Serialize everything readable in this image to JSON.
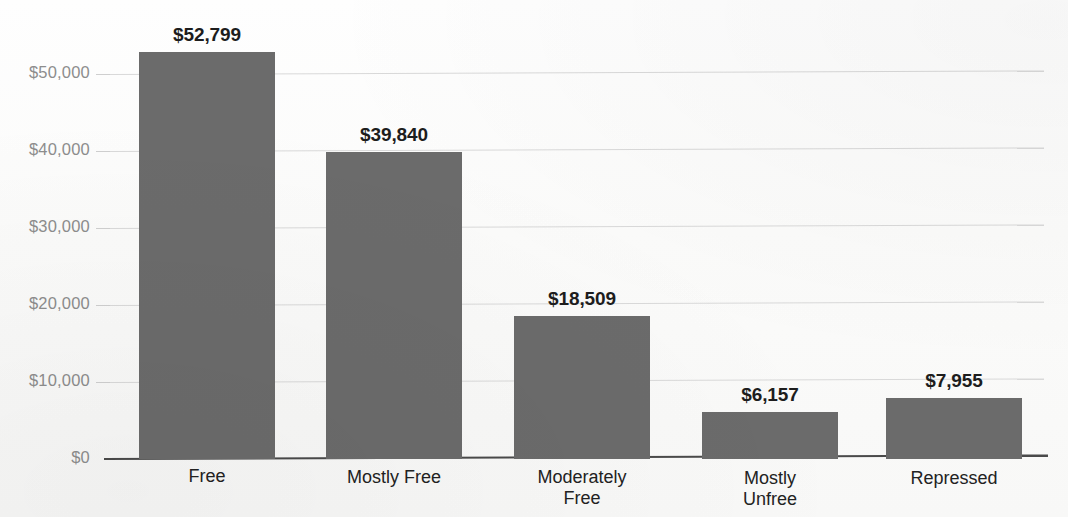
{
  "chart_data": {
    "type": "bar",
    "title": "",
    "subtitle": "",
    "xlabel": "",
    "ylabel": "",
    "categories": [
      "Free",
      "Mostly Free",
      "Moderately Free",
      "Mostly Unfree",
      "Repressed"
    ],
    "category_lines": [
      [
        "Free"
      ],
      [
        "Mostly Free"
      ],
      [
        "Moderately",
        "Free"
      ],
      [
        "Mostly",
        "Unfree"
      ],
      [
        "Repressed"
      ]
    ],
    "values": [
      52799,
      39840,
      18509,
      6157,
      7955
    ],
    "value_labels": [
      "$52,799",
      "$39,840",
      "$18,509",
      "$6,157",
      "$7,955"
    ],
    "ylim": [
      0,
      55000
    ],
    "ytick_values": [
      0,
      10000,
      20000,
      30000,
      40000,
      50000
    ],
    "ytick_labels": [
      "$0",
      "$10,000",
      "$20,000",
      "$30,000",
      "$40,000",
      "$50,000"
    ],
    "grid": true,
    "grid_axis": "y",
    "legend": false,
    "legend_position": "none",
    "bar_color": "#6b6b6b",
    "gridline_color": "#d9d9d9",
    "axis_color": "#4a4a4a",
    "tick_label_color": "#8d8d8d",
    "value_label_color": "#1d1d1d",
    "category_label_color": "#222222",
    "background_color": "#fdfdfc"
  },
  "layout": {
    "baseline_y": 459,
    "px_per_10k": 77.0,
    "plot_left": 108,
    "plot_right": 1044,
    "bar_width": 136,
    "bar_lefts": [
      139,
      326,
      514,
      702,
      886
    ]
  }
}
